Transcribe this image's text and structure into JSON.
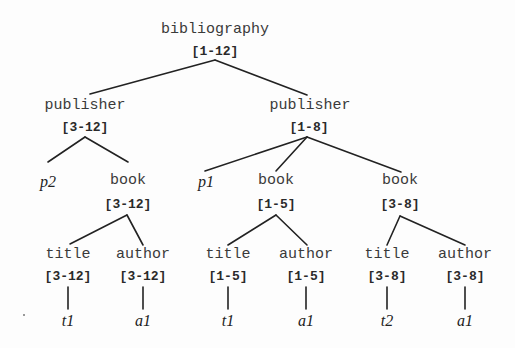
{
  "diagram": {
    "type": "tree",
    "colors": {
      "background": "#fdfdfd",
      "line": "#222222",
      "text": "#3a3a3a"
    },
    "root": {
      "label": "bibliography",
      "range": "[1-12]",
      "children": [
        {
          "label": "publisher",
          "range": "[3-12]",
          "children": [
            {
              "label": "p2",
              "leaf": true
            },
            {
              "label": "book",
              "range": "[3-12]",
              "children": [
                {
                  "label": "title",
                  "range": "[3-12]",
                  "children": [
                    {
                      "label": "t1",
                      "leaf": true
                    }
                  ]
                },
                {
                  "label": "author",
                  "range": "[3-12]",
                  "children": [
                    {
                      "label": "a1",
                      "leaf": true
                    }
                  ]
                }
              ]
            }
          ]
        },
        {
          "label": "publisher",
          "range": "[1-8]",
          "children": [
            {
              "label": "p1",
              "leaf": true
            },
            {
              "label": "book",
              "range": "[1-5]",
              "children": [
                {
                  "label": "title",
                  "range": "[1-5]",
                  "children": [
                    {
                      "label": "t1",
                      "leaf": true
                    }
                  ]
                },
                {
                  "label": "author",
                  "range": "[1-5]",
                  "children": [
                    {
                      "label": "a1",
                      "leaf": true
                    }
                  ]
                }
              ]
            },
            {
              "label": "book",
              "range": "[3-8]",
              "children": [
                {
                  "label": "title",
                  "range": "[3-8]",
                  "children": [
                    {
                      "label": "t2",
                      "leaf": true
                    }
                  ]
                },
                {
                  "label": "author",
                  "range": "[3-8]",
                  "children": [
                    {
                      "label": "a1",
                      "leaf": true
                    }
                  ]
                }
              ]
            }
          ]
        }
      ]
    }
  },
  "nodes": {
    "root": {
      "tag": "bibliography",
      "range": "[1-12]"
    },
    "pub1": {
      "tag": "publisher",
      "range": "[3-12]"
    },
    "pub2": {
      "tag": "publisher",
      "range": "[1-8]"
    },
    "p2": {
      "leaf": "p2"
    },
    "book1": {
      "tag": "book",
      "range": "[3-12]"
    },
    "p1": {
      "leaf": "p1"
    },
    "book2": {
      "tag": "book",
      "range": "[1-5]"
    },
    "book3": {
      "tag": "book",
      "range": "[3-8]"
    },
    "title1": {
      "tag": "title",
      "range": "[3-12]",
      "leaf": "t1"
    },
    "author1": {
      "tag": "author",
      "range": "[3-12]",
      "leaf": "a1"
    },
    "title2": {
      "tag": "title",
      "range": "[1-5]",
      "leaf": "t1"
    },
    "author2": {
      "tag": "author",
      "range": "[1-5]",
      "leaf": "a1"
    },
    "title3": {
      "tag": "title",
      "range": "[3-8]",
      "leaf": "t2"
    },
    "author3": {
      "tag": "author",
      "range": "[3-8]",
      "leaf": "a1"
    }
  }
}
